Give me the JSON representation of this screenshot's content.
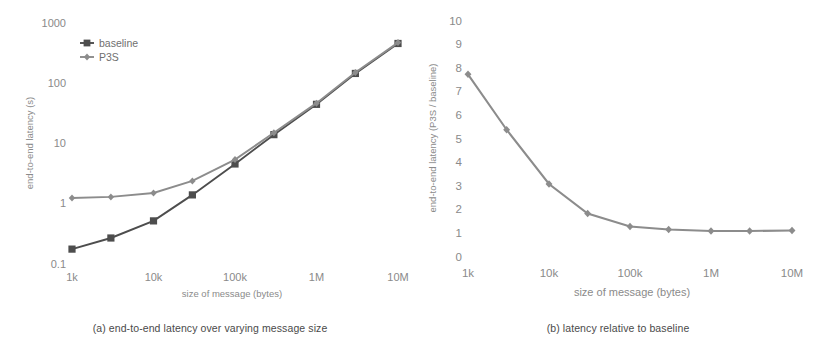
{
  "figure": {
    "panels": [
      {
        "id": "a",
        "caption": "(a) end-to-end latency over varying message size"
      },
      {
        "id": "b",
        "caption": "(b) latency relative to baseline"
      }
    ]
  },
  "colors": {
    "baseline": "#4d4d4d",
    "p3s": "#8c8c8c",
    "ratio": "#8c8c8c",
    "text": "#8a8a8a",
    "caption": "#4a4a4a",
    "background": "#ffffff"
  },
  "chart_data": [
    {
      "type": "line",
      "id": "panel-a",
      "title": "",
      "caption": "(a) end-to-end latency over varying message size",
      "xlabel": "size of message (bytes)",
      "ylabel": "end-to-end latency (s)",
      "xscale": "log",
      "yscale": "log",
      "xlim": [
        1000,
        10000000
      ],
      "ylim": [
        0.1,
        1000
      ],
      "grid": false,
      "legend_position": "upper-left",
      "xticklabels": [
        "1k",
        "10k",
        "100k",
        "1M",
        "10M"
      ],
      "xtickvalues": [
        1000,
        10000,
        100000,
        1000000,
        10000000
      ],
      "yticklabels": [
        "0.1",
        "1",
        "10",
        "100",
        "1000"
      ],
      "ytickvalues": [
        0.1,
        1,
        10,
        100,
        1000
      ],
      "x": [
        1000,
        3000,
        10000,
        30000,
        100000,
        300000,
        1000000,
        3000000,
        10000000
      ],
      "series": [
        {
          "name": "baseline",
          "marker": "square",
          "color": "#4d4d4d",
          "values": [
            0.17,
            0.26,
            0.5,
            1.35,
            4.4,
            13.5,
            43,
            140,
            440
          ]
        },
        {
          "name": "P3S",
          "marker": "diamond",
          "color": "#8c8c8c",
          "values": [
            1.2,
            1.25,
            1.45,
            2.3,
            5.2,
            14.5,
            45,
            145,
            455
          ]
        }
      ]
    },
    {
      "type": "line",
      "id": "panel-b",
      "title": "",
      "caption": "(b) latency relative to baseline",
      "xlabel": "size of message (bytes)",
      "ylabel": "end-to-end latency (P3S / baseline)",
      "xscale": "log",
      "yscale": "linear",
      "xlim": [
        1000,
        10000000
      ],
      "ylim": [
        0,
        10
      ],
      "grid": false,
      "legend_position": "none",
      "xticklabels": [
        "1k",
        "10k",
        "100k",
        "1M",
        "10M"
      ],
      "xtickvalues": [
        1000,
        10000,
        100000,
        1000000,
        10000000
      ],
      "yticklabels": [
        "0",
        "1",
        "2",
        "3",
        "4",
        "5",
        "6",
        "7",
        "8",
        "9",
        "10"
      ],
      "ytickvalues": [
        0,
        1,
        2,
        3,
        4,
        5,
        6,
        7,
        8,
        9,
        10
      ],
      "x": [
        1000,
        3000,
        10000,
        30000,
        100000,
        300000,
        1000000,
        3000000,
        10000000
      ],
      "series": [
        {
          "name": "P3S / baseline",
          "marker": "diamond",
          "color": "#8c8c8c",
          "values": [
            7.7,
            5.35,
            3.05,
            1.8,
            1.25,
            1.12,
            1.06,
            1.06,
            1.08
          ]
        }
      ]
    }
  ]
}
